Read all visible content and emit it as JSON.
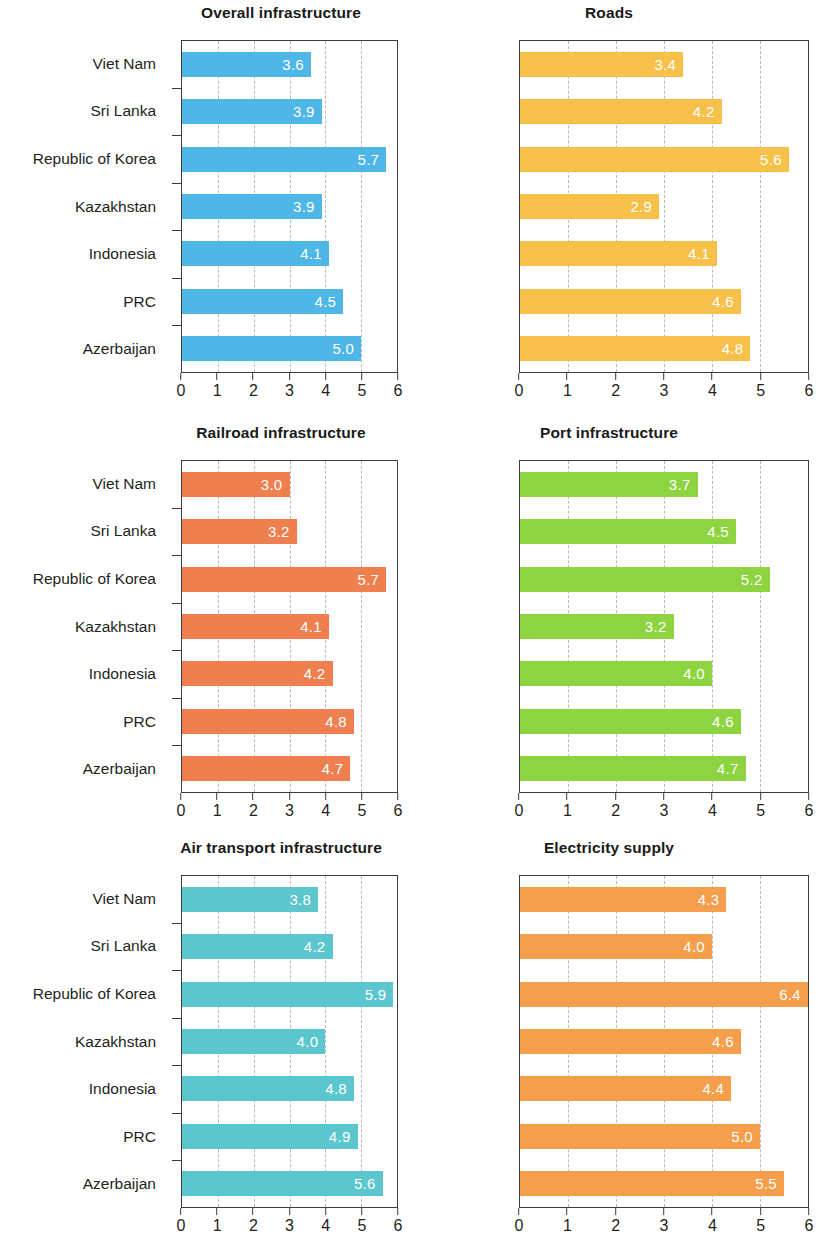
{
  "figure": {
    "categories": [
      "Viet Nam",
      "Sri Lanka",
      "Republic of Korea",
      "Kazakhstan",
      "Indonesia",
      "PRC",
      "Azerbaijan"
    ],
    "x_ticks": [
      "0",
      "1",
      "2",
      "3",
      "4",
      "5",
      "6"
    ]
  },
  "chart_data": [
    {
      "type": "bar",
      "orientation": "horizontal",
      "title": "Overall infrastructure",
      "categories": [
        "Viet Nam",
        "Sri Lanka",
        "Republic of Korea",
        "Kazakhstan",
        "Indonesia",
        "PRC",
        "Azerbaijan"
      ],
      "values": [
        3.6,
        3.9,
        5.7,
        3.9,
        4.1,
        4.5,
        5.0
      ],
      "labels": [
        "3.6",
        "3.9",
        "5.7",
        "3.9",
        "4.1",
        "4.5",
        "5.0"
      ],
      "color": "#4FB6E8",
      "xlabel": "",
      "ylabel": "",
      "xlim": [
        0,
        6
      ],
      "xticks": [
        0,
        1,
        2,
        3,
        4,
        5,
        6
      ],
      "grid": "vertical-dashed",
      "legend": "none"
    },
    {
      "type": "bar",
      "orientation": "horizontal",
      "title": "Roads",
      "categories": [
        "Viet Nam",
        "Sri Lanka",
        "Republic of Korea",
        "Kazakhstan",
        "Indonesia",
        "PRC",
        "Azerbaijan"
      ],
      "values": [
        3.4,
        4.2,
        5.6,
        2.9,
        4.1,
        4.6,
        4.8
      ],
      "labels": [
        "3.4",
        "4.2",
        "5.6",
        "2.9",
        "4.1",
        "4.6",
        "4.8"
      ],
      "color": "#F7C04A",
      "xlabel": "",
      "ylabel": "",
      "xlim": [
        0,
        6
      ],
      "xticks": [
        0,
        1,
        2,
        3,
        4,
        5,
        6
      ],
      "grid": "vertical-dashed",
      "legend": "none"
    },
    {
      "type": "bar",
      "orientation": "horizontal",
      "title": "Railroad infrastructure",
      "categories": [
        "Viet Nam",
        "Sri Lanka",
        "Republic of Korea",
        "Kazakhstan",
        "Indonesia",
        "PRC",
        "Azerbaijan"
      ],
      "values": [
        3.0,
        3.2,
        5.7,
        4.1,
        4.2,
        4.8,
        4.7
      ],
      "labels": [
        "3.0",
        "3.2",
        "5.7",
        "4.1",
        "4.2",
        "4.8",
        "4.7"
      ],
      "color": "#F07F4F",
      "xlabel": "",
      "ylabel": "",
      "xlim": [
        0,
        6
      ],
      "xticks": [
        0,
        1,
        2,
        3,
        4,
        5,
        6
      ],
      "grid": "vertical-dashed",
      "legend": "none"
    },
    {
      "type": "bar",
      "orientation": "horizontal",
      "title": "Port infrastructure",
      "categories": [
        "Viet Nam",
        "Sri Lanka",
        "Republic of Korea",
        "Kazakhstan",
        "Indonesia",
        "PRC",
        "Azerbaijan"
      ],
      "values": [
        3.7,
        4.5,
        5.2,
        3.2,
        4.0,
        4.6,
        4.7
      ],
      "labels": [
        "3.7",
        "4.5",
        "5.2",
        "3.2",
        "4.0",
        "4.6",
        "4.7"
      ],
      "color": "#8DD440",
      "xlabel": "",
      "ylabel": "",
      "xlim": [
        0,
        6
      ],
      "xticks": [
        0,
        1,
        2,
        3,
        4,
        5,
        6
      ],
      "grid": "vertical-dashed",
      "legend": "none"
    },
    {
      "type": "bar",
      "orientation": "horizontal",
      "title": "Air transport infrastructure",
      "categories": [
        "Viet Nam",
        "Sri Lanka",
        "Republic of Korea",
        "Kazakhstan",
        "Indonesia",
        "PRC",
        "Azerbaijan"
      ],
      "values": [
        3.8,
        4.2,
        5.9,
        4.0,
        4.8,
        4.9,
        5.6
      ],
      "labels": [
        "3.8",
        "4.2",
        "5.9",
        "4.0",
        "4.8",
        "4.9",
        "5.6"
      ],
      "color": "#5CC6CE",
      "xlabel": "",
      "ylabel": "",
      "xlim": [
        0,
        6
      ],
      "xticks": [
        0,
        1,
        2,
        3,
        4,
        5,
        6
      ],
      "grid": "vertical-dashed",
      "legend": "none"
    },
    {
      "type": "bar",
      "orientation": "horizontal",
      "title": "Electricity supply",
      "categories": [
        "Viet Nam",
        "Sri Lanka",
        "Republic of Korea",
        "Kazakhstan",
        "Indonesia",
        "PRC",
        "Azerbaijan"
      ],
      "values": [
        4.3,
        4.0,
        6.4,
        4.6,
        4.4,
        5.0,
        5.5
      ],
      "labels": [
        "4.3",
        "4.0",
        "6.4",
        "4.6",
        "4.4",
        "5.0",
        "5.5"
      ],
      "color": "#F59E4B",
      "xlabel": "",
      "ylabel": "",
      "xlim": [
        0,
        6
      ],
      "xticks": [
        0,
        1,
        2,
        3,
        4,
        5,
        6
      ],
      "grid": "vertical-dashed",
      "legend": "none"
    }
  ]
}
